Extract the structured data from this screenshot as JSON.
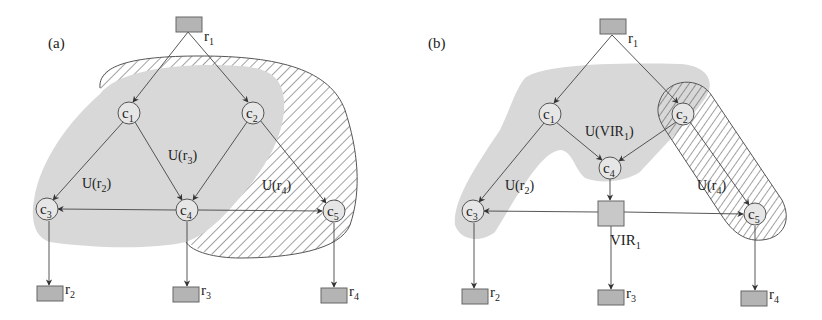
{
  "colors": {
    "shade": "#d8d8d8",
    "resource_box": "#b4b4b4",
    "vir_box": "#c8c8c8",
    "node_fill": "#e6e6e6",
    "stroke": "#555555"
  },
  "panel_a": {
    "label": "(a)",
    "resources": [
      {
        "id": "r1",
        "label": "r",
        "sub": "1",
        "x": 176,
        "y": 17
      },
      {
        "id": "r2",
        "label": "r",
        "sub": "2",
        "x": 37,
        "y": 286
      },
      {
        "id": "r3",
        "label": "r",
        "sub": "3",
        "x": 173,
        "y": 287
      },
      {
        "id": "r4",
        "label": "r",
        "sub": "4",
        "x": 321,
        "y": 288
      }
    ],
    "nodes": [
      {
        "id": "c1",
        "label": "c",
        "sub": "1",
        "cx": 129,
        "cy": 113
      },
      {
        "id": "c2",
        "label": "c",
        "sub": "2",
        "cx": 253,
        "cy": 113
      },
      {
        "id": "c3",
        "label": "c",
        "sub": "3",
        "cx": 47,
        "cy": 209
      },
      {
        "id": "c4",
        "label": "c",
        "sub": "4",
        "cx": 187,
        "cy": 210
      },
      {
        "id": "c5",
        "label": "c",
        "sub": "5",
        "cx": 334,
        "cy": 211
      }
    ],
    "regions": [
      {
        "label": "U(r",
        "sub": "2",
        "close": ")",
        "x": 82,
        "y": 188
      },
      {
        "label": "U(r",
        "sub": "3",
        "close": ")",
        "x": 168,
        "y": 160
      },
      {
        "label": "U(r",
        "sub": "4",
        "close": ")",
        "x": 262,
        "y": 190
      }
    ]
  },
  "panel_b": {
    "label": "(b)",
    "resources": [
      {
        "id": "r1",
        "label": "r",
        "sub": "1",
        "x": 600,
        "y": 19
      },
      {
        "id": "r2",
        "label": "r",
        "sub": "2",
        "x": 462,
        "y": 289
      },
      {
        "id": "r3",
        "label": "r",
        "sub": "3",
        "x": 598,
        "y": 290
      },
      {
        "id": "r4",
        "label": "r",
        "sub": "4",
        "x": 741,
        "y": 291
      }
    ],
    "nodes": [
      {
        "id": "c1",
        "label": "c",
        "sub": "1",
        "cx": 550,
        "cy": 114
      },
      {
        "id": "c2",
        "label": "c",
        "sub": "2",
        "cx": 683,
        "cy": 114
      },
      {
        "id": "c3",
        "label": "c",
        "sub": "3",
        "cx": 473,
        "cy": 211
      },
      {
        "id": "c4",
        "label": "c",
        "sub": "4",
        "cx": 610,
        "cy": 168
      },
      {
        "id": "c5",
        "label": "c",
        "sub": "5",
        "cx": 755,
        "cy": 214
      }
    ],
    "vir": {
      "label": "VIR",
      "sub": "1",
      "x": 598,
      "y": 201
    },
    "regions": [
      {
        "label": "U(r",
        "sub": "2",
        "close": ")",
        "x": 505,
        "y": 190
      },
      {
        "label": "U(VIR",
        "sub": "1",
        "close": ")",
        "x": 585,
        "y": 136
      },
      {
        "label": "U(r",
        "sub": "4",
        "close": ")",
        "x": 697,
        "y": 190
      }
    ]
  }
}
